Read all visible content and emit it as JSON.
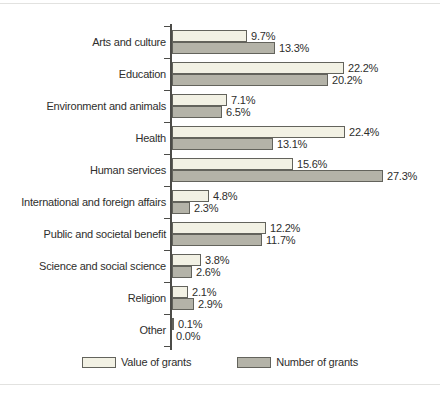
{
  "chart_data": {
    "type": "bar",
    "orientation": "horizontal",
    "title": "",
    "xlabel": "",
    "ylabel": "",
    "xlim": [
      0,
      30
    ],
    "grid": false,
    "legend_position": "bottom",
    "categories": [
      "Arts and culture",
      "Education",
      "Environment and animals",
      "Health",
      "Human services",
      "International and foreign affairs",
      "Public and societal benefit",
      "Science and social science",
      "Religion",
      "Other"
    ],
    "series": [
      {
        "name": "Value of grants",
        "color": "#f2f1e4",
        "values": [
          9.7,
          22.2,
          7.1,
          22.4,
          15.6,
          4.8,
          12.2,
          3.8,
          2.1,
          0.1
        ],
        "labels": [
          "9.7%",
          "22.2%",
          "7.1%",
          "22.4%",
          "15.6%",
          "4.8%",
          "12.2%",
          "3.8%",
          "2.1%",
          "0.1%"
        ]
      },
      {
        "name": "Number of grants",
        "color": "#b4b3a8",
        "values": [
          13.3,
          20.2,
          6.5,
          13.1,
          27.3,
          2.3,
          11.7,
          2.6,
          2.9,
          0.0
        ],
        "labels": [
          "13.3%",
          "20.2%",
          "6.5%",
          "13.1%",
          "27.3%",
          "2.3%",
          "11.7%",
          "2.6%",
          "2.9%",
          "0.0%"
        ]
      }
    ]
  }
}
